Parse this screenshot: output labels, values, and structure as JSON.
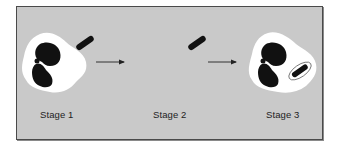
{
  "figure": {
    "title": "",
    "stages": [
      {
        "label": "Stage 1",
        "description": "Phagocyte with bacterium approaching"
      },
      {
        "label": "Stage 2",
        "description": "Bacterium alone"
      },
      {
        "label": "Stage 3",
        "description": "Phagocyte with engulfed bacterium in vacuole"
      }
    ],
    "colors": {
      "background": "#c9c9c9",
      "cell": "#ffffff",
      "nucleus": "#111111",
      "bacterium": "#111111",
      "border": "#4a4a4a"
    }
  }
}
